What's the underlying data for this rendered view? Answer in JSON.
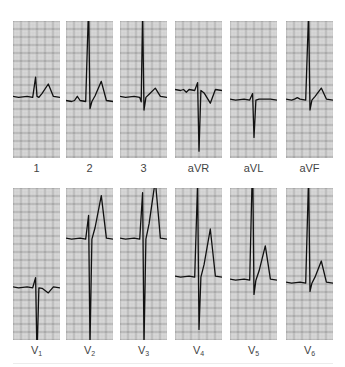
{
  "figure": {
    "colors": {
      "paper": "#e6e6e6",
      "grid_minor": "#b8b8b8",
      "grid_major": "#6e6e6e",
      "trace": "#111111",
      "label": "#444444"
    },
    "limb_leads": [
      {
        "id": "I",
        "label": "1",
        "sub": ""
      },
      {
        "id": "II",
        "label": "2",
        "sub": ""
      },
      {
        "id": "III",
        "label": "3",
        "sub": ""
      },
      {
        "id": "aVR",
        "label": "aVR",
        "sub": ""
      },
      {
        "id": "aVL",
        "label": "aVL",
        "sub": ""
      },
      {
        "id": "aVF",
        "label": "aVF",
        "sub": ""
      }
    ],
    "chest_leads": [
      {
        "id": "V1",
        "label": "V",
        "sub": "1"
      },
      {
        "id": "V2",
        "label": "V",
        "sub": "2"
      },
      {
        "id": "V3",
        "label": "V",
        "sub": "3"
      },
      {
        "id": "V4",
        "label": "V",
        "sub": "4"
      },
      {
        "id": "V5",
        "label": "V",
        "sub": "5"
      },
      {
        "id": "V6",
        "label": "V",
        "sub": "6"
      }
    ],
    "waveforms": {
      "I": {
        "baseline": 0.55,
        "r": 0.14,
        "s": 0.0,
        "t": 0.09,
        "q": 0.0,
        "p": 0.0
      },
      "II": {
        "baseline": 0.58,
        "r": 0.7,
        "s": 0.06,
        "t": 0.14,
        "q": 0.0,
        "p": 0.03
      },
      "III": {
        "baseline": 0.55,
        "r": 0.62,
        "s": 0.1,
        "t": 0.06,
        "q": 0.04,
        "p": 0.0
      },
      "aVR": {
        "baseline": 0.5,
        "r": 0.05,
        "s": 0.45,
        "t": -0.1,
        "q": 0.0,
        "p": -0.02
      },
      "aVL": {
        "baseline": 0.57,
        "r": 0.04,
        "s": 0.28,
        "t": 0.0,
        "q": 0.0,
        "p": 0.0
      },
      "aVF": {
        "baseline": 0.57,
        "r": 0.64,
        "s": 0.08,
        "t": 0.08,
        "q": 0.0,
        "p": 0.01
      },
      "V1": {
        "baseline": 0.65,
        "r": 0.06,
        "s": 0.45,
        "t": -0.04,
        "q": 0.0,
        "p": 0.0
      },
      "V2": {
        "baseline": 0.33,
        "r": 0.15,
        "s": 0.7,
        "t": 0.28,
        "q": 0.0,
        "p": 0.0
      },
      "V3": {
        "baseline": 0.33,
        "r": 0.3,
        "s": 0.7,
        "t": 0.38,
        "q": 0.0,
        "p": 0.0
      },
      "V4": {
        "baseline": 0.58,
        "r": 0.62,
        "s": 0.35,
        "t": 0.31,
        "q": 0.0,
        "p": 0.0
      },
      "V5": {
        "baseline": 0.6,
        "r": 0.8,
        "s": 0.1,
        "t": 0.22,
        "q": 0.0,
        "p": 0.0
      },
      "V6": {
        "baseline": 0.62,
        "r": 0.7,
        "s": 0.06,
        "t": 0.14,
        "q": 0.0,
        "p": 0.0
      }
    }
  }
}
